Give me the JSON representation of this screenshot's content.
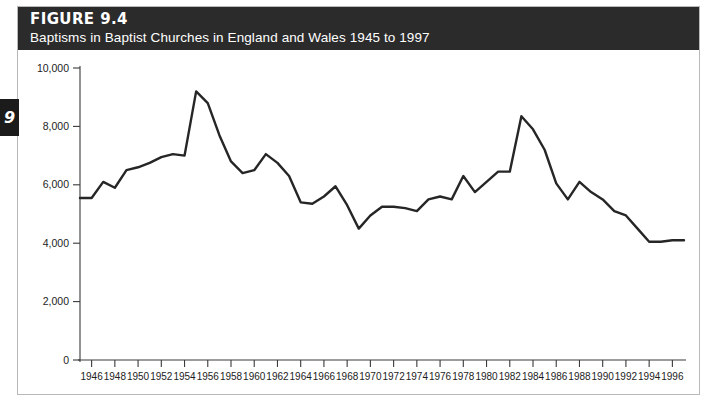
{
  "figure": {
    "number": "FIGURE 9.4",
    "caption": "Baptisms in Baptist Churches in England and Wales 1945 to 1997",
    "chapter_tab": "9"
  },
  "colors": {
    "banner_background": "#2b2b2b",
    "banner_text": "#ffffff",
    "line": "#262626",
    "axis": "#3a3a3a",
    "page_background": "#ffffff",
    "frame_border": "#b9b9b9"
  },
  "chart_data": {
    "type": "line",
    "title": "Baptisms in Baptist Churches in England and Wales 1945 to 1997",
    "xlabel": "",
    "ylabel": "",
    "xlim": [
      1945,
      1997
    ],
    "ylim": [
      0,
      10000
    ],
    "grid": false,
    "legend": false,
    "y_ticks": [
      0,
      2000,
      4000,
      6000,
      8000,
      10000
    ],
    "y_tick_labels": [
      "0",
      "2,000",
      "4,000",
      "6,000",
      "8,000",
      "10,000"
    ],
    "x_ticks": [
      1946,
      1948,
      1950,
      1952,
      1954,
      1956,
      1958,
      1960,
      1962,
      1964,
      1966,
      1968,
      1970,
      1972,
      1974,
      1976,
      1978,
      1980,
      1982,
      1984,
      1986,
      1988,
      1990,
      1992,
      1994,
      1996
    ],
    "x_tick_labels": [
      "1946",
      "1948",
      "1950",
      "1952",
      "1954",
      "1956",
      "1958",
      "1960",
      "1962",
      "1964",
      "1966",
      "1968",
      "1970",
      "1972",
      "1974",
      "1976",
      "1978",
      "1980",
      "1982",
      "1984",
      "1986",
      "1988",
      "1990",
      "1992",
      "1994",
      "1996"
    ],
    "series": [
      {
        "name": "Baptisms",
        "x": [
          1945,
          1946,
          1947,
          1948,
          1949,
          1950,
          1951,
          1952,
          1953,
          1954,
          1955,
          1956,
          1957,
          1958,
          1959,
          1960,
          1961,
          1962,
          1963,
          1964,
          1965,
          1966,
          1967,
          1968,
          1969,
          1970,
          1971,
          1972,
          1973,
          1974,
          1975,
          1976,
          1977,
          1978,
          1979,
          1980,
          1981,
          1982,
          1983,
          1984,
          1985,
          1986,
          1987,
          1988,
          1989,
          1990,
          1991,
          1992,
          1993,
          1994,
          1995,
          1996,
          1997
        ],
        "values": [
          5550,
          5550,
          6100,
          5900,
          6500,
          6600,
          6750,
          6950,
          7050,
          7000,
          9200,
          8800,
          7700,
          6800,
          6400,
          6500,
          7050,
          6750,
          6300,
          5400,
          5350,
          5600,
          5950,
          5300,
          4500,
          4950,
          5250,
          5250,
          5200,
          5100,
          5500,
          5600,
          5500,
          6300,
          5750,
          6100,
          6450,
          6450,
          8350,
          7900,
          7200,
          6050,
          5500,
          6100,
          5750,
          5500,
          5100,
          4950,
          4500,
          4050,
          4050,
          4100,
          4100
        ]
      }
    ]
  }
}
